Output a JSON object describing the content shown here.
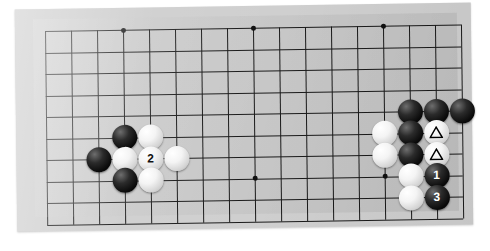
{
  "scene": {
    "kind": "go-board-photograph",
    "description": "Photograph of a Go board (grayscale) showing a life-and-death / joseki problem diagram with numbered move stones and triangle-marked stones",
    "background_color": "#ffffff",
    "board_color": "#cfcfcf",
    "board_surface_color": "#c9c9c9",
    "grid_line_color": "#1a1a1a",
    "black_stone_color": "#0a0a0a",
    "white_stone_color": "#f4f4f4",
    "board_rotation_deg": -0.9
  },
  "grid": {
    "columns": 17,
    "rows": 10,
    "cell_width": 26.0,
    "cell_height": 21.5,
    "origin_x": 12,
    "origin_y": 12,
    "star_points": [
      {
        "col": 3,
        "row": 0,
        "label": "star-point-top-left"
      },
      {
        "col": 8,
        "row": 0,
        "label": "star-point-top-center"
      },
      {
        "col": 13,
        "row": 0,
        "label": "star-point-top-right"
      },
      {
        "col": 8,
        "row": 7,
        "label": "star-point-center"
      },
      {
        "col": 13,
        "row": 7,
        "label": "star-point-right"
      }
    ]
  },
  "stones": [
    {
      "id": "w-left-a",
      "color": "white",
      "col": 4,
      "row": 5,
      "label": "",
      "marker": "none",
      "name": "white-stone-left-upper"
    },
    {
      "id": "b-left-a",
      "color": "black",
      "col": 3,
      "row": 5,
      "label": "",
      "marker": "none",
      "name": "black-stone-left-upper"
    },
    {
      "id": "b-left-b",
      "color": "black",
      "col": 2,
      "row": 6,
      "label": "",
      "marker": "none",
      "name": "black-stone-left-west"
    },
    {
      "id": "w-left-b",
      "color": "white",
      "col": 3,
      "row": 6,
      "label": "",
      "marker": "none",
      "name": "white-stone-left-center-west"
    },
    {
      "id": "w-left-2",
      "color": "white",
      "col": 4,
      "row": 6,
      "label": "2",
      "marker": "none",
      "name": "white-stone-move-2"
    },
    {
      "id": "w-left-c",
      "color": "white",
      "col": 5,
      "row": 6,
      "label": "",
      "marker": "none",
      "name": "white-stone-left-east"
    },
    {
      "id": "b-left-c",
      "color": "black",
      "col": 3,
      "row": 7,
      "label": "",
      "marker": "none",
      "name": "black-stone-left-lower"
    },
    {
      "id": "w-left-d",
      "color": "white",
      "col": 4,
      "row": 7,
      "label": "",
      "marker": "none",
      "name": "white-stone-left-lower"
    },
    {
      "id": "b-r-top-1",
      "color": "black",
      "col": 14,
      "row": 4,
      "label": "",
      "marker": "none",
      "name": "black-stone-right-top-left"
    },
    {
      "id": "b-r-top-2",
      "color": "black",
      "col": 15,
      "row": 4,
      "label": "",
      "marker": "none",
      "name": "black-stone-right-top-center"
    },
    {
      "id": "b-r-top-3",
      "color": "black",
      "col": 16,
      "row": 4,
      "label": "",
      "marker": "none",
      "name": "black-stone-right-top-right"
    },
    {
      "id": "w-r-1",
      "color": "white",
      "col": 13,
      "row": 5,
      "label": "",
      "marker": "none",
      "name": "white-stone-right-west-upper"
    },
    {
      "id": "b-r-1",
      "color": "black",
      "col": 14,
      "row": 5,
      "label": "",
      "marker": "none",
      "name": "black-stone-right-middle-upper"
    },
    {
      "id": "w-tri-1",
      "color": "white",
      "col": 15,
      "row": 5,
      "label": "",
      "marker": "triangle",
      "name": "white-stone-triangle-upper"
    },
    {
      "id": "w-r-2",
      "color": "white",
      "col": 13,
      "row": 6,
      "label": "",
      "marker": "none",
      "name": "white-stone-right-west-lower"
    },
    {
      "id": "b-r-2",
      "color": "black",
      "col": 14,
      "row": 6,
      "label": "",
      "marker": "none",
      "name": "black-stone-right-middle-lower"
    },
    {
      "id": "w-tri-2",
      "color": "white",
      "col": 15,
      "row": 6,
      "label": "",
      "marker": "triangle",
      "name": "white-stone-triangle-lower"
    },
    {
      "id": "w-r-3",
      "color": "white",
      "col": 14,
      "row": 7,
      "label": "",
      "marker": "none",
      "name": "white-stone-right-below"
    },
    {
      "id": "b-r-move1",
      "color": "black",
      "col": 15,
      "row": 7,
      "label": "1",
      "marker": "none",
      "name": "black-stone-move-1"
    },
    {
      "id": "w-r-4",
      "color": "white",
      "col": 14,
      "row": 8,
      "label": "",
      "marker": "none",
      "name": "white-stone-right-bottom"
    },
    {
      "id": "b-r-move3",
      "color": "black",
      "col": 15,
      "row": 8,
      "label": "3",
      "marker": "none",
      "name": "black-stone-move-3"
    }
  ],
  "legend": {
    "move_numbers": [
      "1",
      "2",
      "3"
    ],
    "marker_symbol": "triangle"
  }
}
